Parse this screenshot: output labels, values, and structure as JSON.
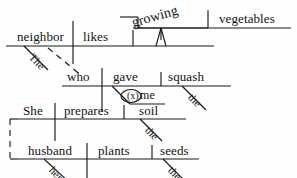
{
  "diagram": {
    "kind": "reed-kellogg-sentence-diagram",
    "sentence": "The neighbor who gave me the squash likes growing vegetables. She prepares the soil and her husband plants the seeds.",
    "ink_color": "#1a1a1a",
    "background_color": "#fefefe",
    "clauses": [
      {
        "id": "main-clause-1",
        "subject": "neighbor",
        "verb": "likes",
        "object": "vegetables",
        "participle": "growing"
      },
      {
        "id": "relative-clause",
        "subject": "who",
        "verb": "gave",
        "object": "squash",
        "indirect_object": "me",
        "elided_preposition_marker": "(x)"
      },
      {
        "id": "coordinate-clause-1",
        "subject": "She",
        "verb": "prepares",
        "object": "soil"
      },
      {
        "id": "coordinate-clause-2",
        "subject": "husband",
        "verb": "plants",
        "object": "seeds"
      }
    ],
    "words": {
      "neighbor": "neighbor",
      "likes": "likes",
      "growing": "growing",
      "vegetables": "vegetables",
      "the_subject_article": "The",
      "who": "who",
      "gave": "gave",
      "me": "me",
      "squash": "squash",
      "the_squash_article": "the",
      "x_marker": "(x)",
      "she": "She",
      "prepares": "prepares",
      "soil": "soil",
      "the_soil_article": "the",
      "and": "and",
      "husband": "husband",
      "her_possessive": "her",
      "plants": "plants",
      "seeds": "seeds",
      "the_seeds_article": "the"
    }
  }
}
